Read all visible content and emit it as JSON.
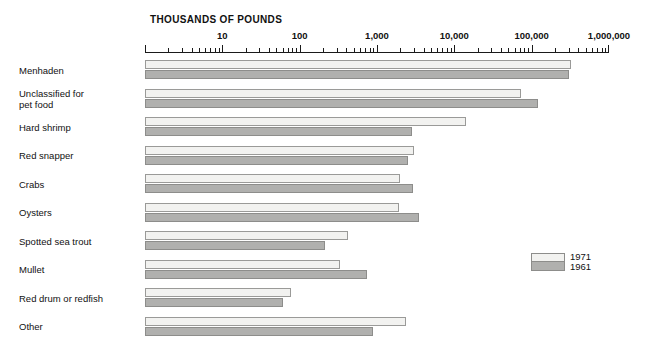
{
  "chart_data": {
    "type": "bar",
    "xlabel": "THOUSANDS OF POUNDS",
    "ylabel": "",
    "orientation": "horizontal",
    "xscale": "log",
    "xlim": [
      1,
      1000000
    ],
    "grid": false,
    "legend_position": "right",
    "tick_labels": [
      "10",
      "100",
      "1,000",
      "10,000",
      "100,000",
      "1,000,000"
    ],
    "tick_values": [
      10,
      100,
      1000,
      10000,
      100000,
      1000000
    ],
    "categories": [
      "Menhaden",
      "Unclassified for\npet food",
      "Hard shrimp",
      "Red snapper",
      "Crabs",
      "Oysters",
      "Spotted sea trout",
      "Mullet",
      "Red drum or redfish",
      "Other"
    ],
    "series": [
      {
        "name": "1971",
        "color": "#f2f2f0",
        "values": [
          320000,
          73000,
          14000,
          3000,
          2000,
          1900,
          420,
          330,
          78,
          2400
        ]
      },
      {
        "name": "1961",
        "color": "#b0b0ae",
        "values": [
          300000,
          120000,
          2800,
          2500,
          2900,
          3500,
          210,
          750,
          61,
          900
        ]
      }
    ]
  },
  "legend": {
    "entries": [
      {
        "label": "1971",
        "swatch": "light"
      },
      {
        "label": "1961",
        "swatch": "gray"
      }
    ]
  },
  "colors": {
    "bar_1971": "#f2f2f0",
    "bar_1961": "#b0b0ae",
    "bar_border": "#8d8d8b",
    "axis": "#1a1a1a",
    "text": "#111111",
    "background": "#ffffff"
  }
}
